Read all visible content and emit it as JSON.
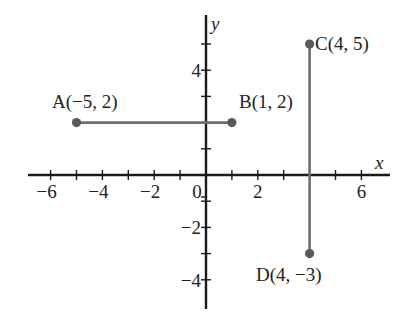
{
  "diagram": {
    "type": "coordinate-plane",
    "axes": {
      "x_label": "x",
      "y_label": "y",
      "x_range": [
        -7,
        7
      ],
      "y_range": [
        -5,
        6
      ],
      "x_tick_step": 1,
      "y_tick_step": 1,
      "x_tick_labels": [
        {
          "value": -6,
          "text": "−6"
        },
        {
          "value": -4,
          "text": "−4"
        },
        {
          "value": -2,
          "text": "−2"
        },
        {
          "value": 0,
          "text": "0"
        },
        {
          "value": 2,
          "text": "2"
        },
        {
          "value": 6,
          "text": "6"
        }
      ],
      "y_tick_labels": [
        {
          "value": 4,
          "text": "4"
        },
        {
          "value": -2,
          "text": "−2"
        },
        {
          "value": -4,
          "text": "−4"
        }
      ]
    },
    "points": [
      {
        "name": "A",
        "x": -5,
        "y": 2,
        "label": "A(−5, 2)"
      },
      {
        "name": "B",
        "x": 1,
        "y": 2,
        "label": "B(1, 2)"
      },
      {
        "name": "C",
        "x": 4,
        "y": 5,
        "label": "C(4, 5)"
      },
      {
        "name": "D",
        "x": 4,
        "y": -3,
        "label": "D(4, −3)"
      }
    ],
    "segments": [
      {
        "from": "A",
        "to": "B"
      },
      {
        "from": "C",
        "to": "D"
      }
    ],
    "colors": {
      "axis": "#1a1a1a",
      "segment": "#6e6e6e",
      "point": "#5a5a5a",
      "text": "#222222"
    }
  }
}
